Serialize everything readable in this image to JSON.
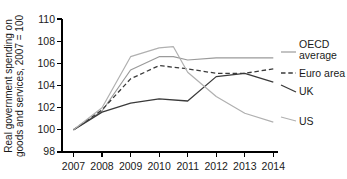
{
  "chart_data": {
    "type": "line",
    "title": "",
    "xlabel": "",
    "ylabel": "Real government spending on goods and services, 2007 = 100",
    "x": [
      2007,
      2008,
      2009,
      2010,
      2011,
      2012,
      2013,
      2014
    ],
    "xlim": [
      2007,
      2014
    ],
    "ylim": [
      98,
      110
    ],
    "yticks": [
      98,
      100,
      102,
      104,
      106,
      108,
      110
    ],
    "xticks": [
      2007,
      2008,
      2009,
      2010,
      2011,
      2012,
      2013,
      2014
    ],
    "xtick_labels": [
      "2007",
      "2008",
      "2009",
      "2010",
      "2011",
      "2012",
      "2013",
      "2014"
    ],
    "ytick_labels": [
      "98",
      "100",
      "102",
      "104",
      "106",
      "108",
      "110"
    ],
    "grid": false,
    "legend_position": "right-inline",
    "series": [
      {
        "name": "OECD average",
        "label": "OECD\naverage",
        "color": "#9a9a9a",
        "style": "solid",
        "width": 1.2,
        "values": [
          100.0,
          101.7,
          105.4,
          106.6,
          106.3,
          106.5,
          106.5,
          106.5
        ]
      },
      {
        "name": "Euro area",
        "label": "Euro area",
        "color": "#3a3a3a",
        "style": "dashed",
        "width": 1.3,
        "values": [
          100.0,
          101.8,
          104.6,
          105.8,
          105.5,
          105.1,
          105.1,
          105.5
        ]
      },
      {
        "name": "UK",
        "label": "UK",
        "color": "#3a3a3a",
        "style": "solid",
        "width": 1.3,
        "values": [
          100.0,
          101.6,
          102.4,
          102.8,
          102.6,
          104.8,
          105.1,
          104.3
        ]
      },
      {
        "name": "US",
        "label": "US",
        "color": "#b0b0b0",
        "style": "solid",
        "width": 1.2,
        "values": [
          100.0,
          102.0,
          106.6,
          107.4,
          105.2,
          103.0,
          101.5,
          100.7
        ]
      }
    ],
    "peak_annotations": [
      {
        "series": "US",
        "year": 2010,
        "value": 107.5,
        "note": "highest point of all series"
      },
      {
        "series": "OECD average",
        "year": 2010,
        "value": 106.6
      }
    ]
  },
  "axis": {
    "ylabel_line1": "Real government spending on",
    "ylabel_line2": "goods and services, 2007 = 100"
  },
  "legend": {
    "oecd_line1": "OECD",
    "oecd_line2": "average",
    "euro": "Euro area",
    "uk": "UK",
    "us": "US"
  }
}
